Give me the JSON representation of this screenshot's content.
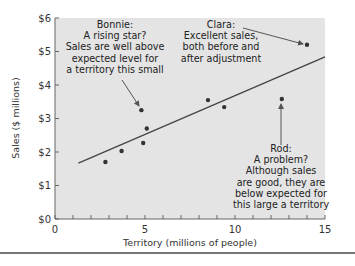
{
  "chart_data": {
    "type": "scatter",
    "title": "",
    "xlabel": "Territory (millions of people)",
    "ylabel": "Sales ($ millions)",
    "xlim": [
      0,
      15
    ],
    "ylim": [
      0,
      6
    ],
    "x_ticks": [
      0,
      5,
      10,
      15
    ],
    "x_minor_ticks": [
      1,
      2,
      3,
      4,
      6,
      7,
      8,
      9,
      11,
      12,
      13,
      14
    ],
    "y_ticks": [
      0,
      1,
      2,
      3,
      4,
      5,
      6
    ],
    "y_tick_labels": [
      "$0",
      "$1",
      "$2",
      "$3",
      "$4",
      "$5",
      "$6"
    ],
    "grid": false,
    "legend": "none",
    "background": "#e4e4e4",
    "series": [
      {
        "name": "Sales representatives",
        "points": [
          {
            "x": 2.8,
            "y": 1.7
          },
          {
            "x": 3.7,
            "y": 2.03
          },
          {
            "x": 4.8,
            "y": 3.25,
            "label": "Bonnie"
          },
          {
            "x": 4.9,
            "y": 2.27
          },
          {
            "x": 5.1,
            "y": 2.7
          },
          {
            "x": 8.5,
            "y": 3.55
          },
          {
            "x": 9.4,
            "y": 3.34
          },
          {
            "x": 12.6,
            "y": 3.58,
            "label": "Rod"
          },
          {
            "x": 14.0,
            "y": 5.2,
            "label": "Clara"
          }
        ]
      }
    ],
    "regression_line": {
      "x1": 1.3,
      "y1": 1.67,
      "x2": 15.0,
      "y2": 4.84
    },
    "annotations": [
      {
        "name": "Bonnie",
        "lines": [
          "Bonnie:",
          "A rising star?",
          "Sales are well above",
          "expected level for",
          "a territory this small"
        ],
        "target": {
          "x": 4.8,
          "y": 3.25
        }
      },
      {
        "name": "Clara",
        "lines": [
          "Clara:",
          "Excellent sales,",
          "both before and",
          "after adjustment"
        ],
        "target": {
          "x": 14.0,
          "y": 5.2
        }
      },
      {
        "name": "Rod",
        "lines": [
          "Rod:",
          "A problem?",
          "Although sales",
          "are good, they are",
          "below expected for",
          "this large a territory"
        ],
        "target": {
          "x": 12.6,
          "y": 3.58
        }
      }
    ]
  },
  "colors": {
    "plot_bg": "#e4e4e4",
    "point": "#333333",
    "line": "#444444",
    "arrow": "#555555"
  }
}
